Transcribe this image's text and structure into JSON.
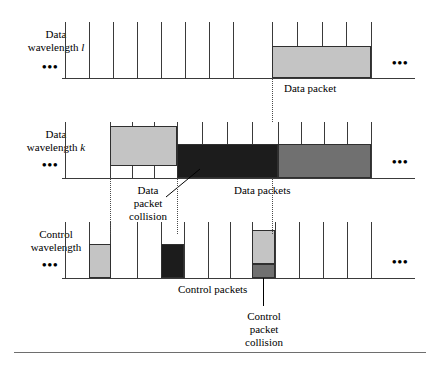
{
  "figure": {
    "width": 438,
    "height": 368,
    "colors": {
      "light_gray": "#c4c4c4",
      "medium_gray": "#707070",
      "dark": "#1c1c1c",
      "stroke": "#3a3a3a"
    }
  },
  "rows": [
    {
      "id": "data-wavelength-l",
      "label_line1": "Data",
      "label_line2": "wavelength",
      "label_symbol": "l",
      "left_ellipsis": "•••",
      "right_ellipsis": "•••",
      "baseline_y": 78,
      "tick_start_x": 65,
      "tick_spacing": 24,
      "tick_count": 14,
      "tick_height": 56,
      "packets": [
        {
          "name": "data-packet",
          "x": 272,
          "width": 99,
          "y": 46,
          "height": 32,
          "shade": "light"
        }
      ],
      "annotations": [
        {
          "name": "data-packet-label",
          "text": "Data packet",
          "x": 284,
          "y": 82
        }
      ]
    },
    {
      "id": "data-wavelength-k",
      "label_line1": "Data",
      "label_line2": "wavelength",
      "label_symbol": "k",
      "left_ellipsis": "•••",
      "right_ellipsis": "•••",
      "baseline_y": 178,
      "tick_start_x": 65,
      "tick_spacing": 24,
      "tick_count": 14,
      "tick_height": 56,
      "packets": [
        {
          "name": "data-packet-light-k",
          "x": 110,
          "width": 67,
          "y": 126,
          "height": 40,
          "shade": "light"
        },
        {
          "name": "data-packet-collision-block",
          "x": 177,
          "width": 101,
          "y": 144,
          "height": 34,
          "shade": "dark"
        },
        {
          "name": "data-packet-medium-k",
          "x": 278,
          "width": 93,
          "y": 144,
          "height": 34,
          "shade": "medium"
        }
      ],
      "annotations": [
        {
          "name": "data-packet-collision-label",
          "text": "Data\npacket\ncollision",
          "x": 118,
          "y": 184
        },
        {
          "name": "data-packets-label",
          "text": "Data packets",
          "x": 234,
          "y": 184
        }
      ]
    },
    {
      "id": "control-wavelength",
      "label_line1": "Control",
      "label_line2": "wavelength",
      "label_symbol": "",
      "left_ellipsis": "•••",
      "right_ellipsis": "•••",
      "baseline_y": 278,
      "tick_start_x": 65,
      "tick_spacing": 24,
      "tick_count": 14,
      "tick_height": 56,
      "packets": [
        {
          "name": "control-packet-light",
          "x": 89,
          "width": 22,
          "y": 244,
          "height": 34,
          "shade": "light"
        },
        {
          "name": "control-packet-dark",
          "x": 161,
          "width": 23,
          "y": 244,
          "height": 34,
          "shade": "dark"
        },
        {
          "name": "control-packet-collision-top",
          "x": 252,
          "width": 23,
          "y": 230,
          "height": 34,
          "shade": "light"
        },
        {
          "name": "control-packet-collision-bottom",
          "x": 252,
          "width": 23,
          "y": 264,
          "height": 14,
          "shade": "medium"
        }
      ],
      "annotations": [
        {
          "name": "control-packets-label",
          "text": "Control packets",
          "x": 178,
          "y": 283
        },
        {
          "name": "control-packet-collision-label",
          "text": "Control\npacket\ncollision",
          "x": 238,
          "y": 312
        }
      ]
    }
  ],
  "guides": [
    {
      "name": "guide-left-collision",
      "x": 110,
      "y": 178,
      "height": 56
    },
    {
      "name": "guide-right-collision",
      "x": 177,
      "y": 178,
      "height": 56
    },
    {
      "name": "guide-packet-start-top",
      "x": 272,
      "y": 78,
      "height": 44
    },
    {
      "name": "guide-packet-start-mid",
      "x": 272,
      "y": 178,
      "height": 56
    }
  ],
  "leaders": [
    {
      "name": "leader-data-packet-collision",
      "x1": 168,
      "y1": 196,
      "x2": 196,
      "y2": 172
    },
    {
      "name": "leader-control-packet-collision",
      "x": 263,
      "y": 278,
      "height": 28
    }
  ],
  "footer": {
    "rule_x": 14,
    "rule_y": 352,
    "rule_width": 412
  }
}
